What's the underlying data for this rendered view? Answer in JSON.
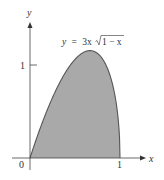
{
  "chart": {
    "equation": "y = 3x√1 − x",
    "equation_parts": {
      "lhs": "y",
      "eq": "=",
      "coef": "3x",
      "radicand": "1 − x"
    },
    "x_axis_label": "x",
    "y_axis_label": "y",
    "origin_label": "0",
    "x_tick_label": "1",
    "y_tick_label": "1",
    "fill_color": "#a9a9a9",
    "curve_color": "#555555",
    "axis_color": "#444444"
  },
  "chart_data": {
    "type": "area",
    "function": "3*x*sqrt(1-x)",
    "xlabel": "x",
    "ylabel": "y",
    "xlim": [
      0,
      1
    ],
    "ylim": [
      0,
      1.155
    ],
    "x_ticks": [
      0,
      1
    ],
    "y_ticks": [
      1
    ],
    "x": [
      0,
      0.1,
      0.2,
      0.3,
      0.4,
      0.5,
      0.6,
      0.667,
      0.7,
      0.8,
      0.9,
      0.95,
      1.0
    ],
    "y": [
      0,
      0.285,
      0.537,
      0.753,
      0.93,
      1.061,
      1.138,
      1.155,
      1.15,
      1.073,
      0.854,
      0.637,
      0
    ],
    "shaded_region": "area under curve from x=0 to x=1",
    "grid": false,
    "legend": null
  }
}
